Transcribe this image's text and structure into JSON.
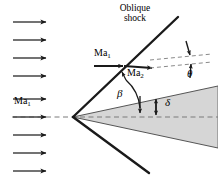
{
  "figure": {
    "labels": {
      "oblique_shock_line1": "Oblique",
      "oblique_shock_line2": "shock",
      "ma_freestream_left": "Ma",
      "ma_freestream_left_sub": "1",
      "ma_upstream": "Ma",
      "ma_upstream_sub": "1",
      "ma_downstream": "Ma",
      "ma_downstream_sub": "2",
      "beta": "β",
      "theta": "θ",
      "delta": "δ"
    },
    "colors": {
      "stroke": "#1a1a1a",
      "cone_fill": "#d6d6d6",
      "cone_edge": "#555555",
      "dashed": "#7a7a7a",
      "background": "#ffffff"
    },
    "geometry": {
      "apex_x": 73,
      "apex_y": 117,
      "shock_upper_end_x": 178,
      "shock_upper_end_y": 17,
      "shock_lower_end_x": 149,
      "shock_lower_end_y": 173,
      "cone_right_x": 218,
      "cone_upper_right_y": 86,
      "cone_lower_right_y": 148,
      "beta_deg": 43,
      "theta_deg": 5,
      "delta_deg": 16
    },
    "freestream_arrows": {
      "count": 8,
      "x_start": 13,
      "x_end": 50,
      "y_positions": [
        22,
        40,
        58,
        76,
        95,
        113,
        131,
        150,
        168
      ]
    }
  }
}
